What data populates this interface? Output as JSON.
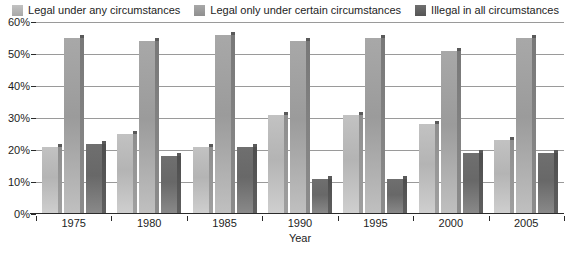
{
  "chart_data": {
    "type": "bar",
    "title": "",
    "xlabel": "Year",
    "ylabel": "",
    "categories": [
      "1975",
      "1980",
      "1985",
      "1990",
      "1995",
      "2000",
      "2005"
    ],
    "series": [
      {
        "name": "Legal under any circumstances",
        "color": "#b8b8b8",
        "values": [
          21,
          25,
          21,
          31,
          31,
          28,
          23
        ]
      },
      {
        "name": "Legal only under certain circumstances",
        "color": "#9e9e9e",
        "values": [
          55,
          54,
          56,
          54,
          55,
          51,
          55
        ]
      },
      {
        "name": "Illegal in all circumstances",
        "color": "#6b6b6b",
        "values": [
          22,
          18,
          21,
          11,
          11,
          19,
          19
        ]
      }
    ],
    "ylim": [
      0,
      60
    ],
    "ytick_labels": [
      "0%",
      "10%",
      "20%",
      "30%",
      "40%",
      "50%",
      "60%"
    ],
    "ytick_values": [
      0,
      10,
      20,
      30,
      40,
      50,
      60
    ],
    "grid": true,
    "legend_position": "top"
  }
}
